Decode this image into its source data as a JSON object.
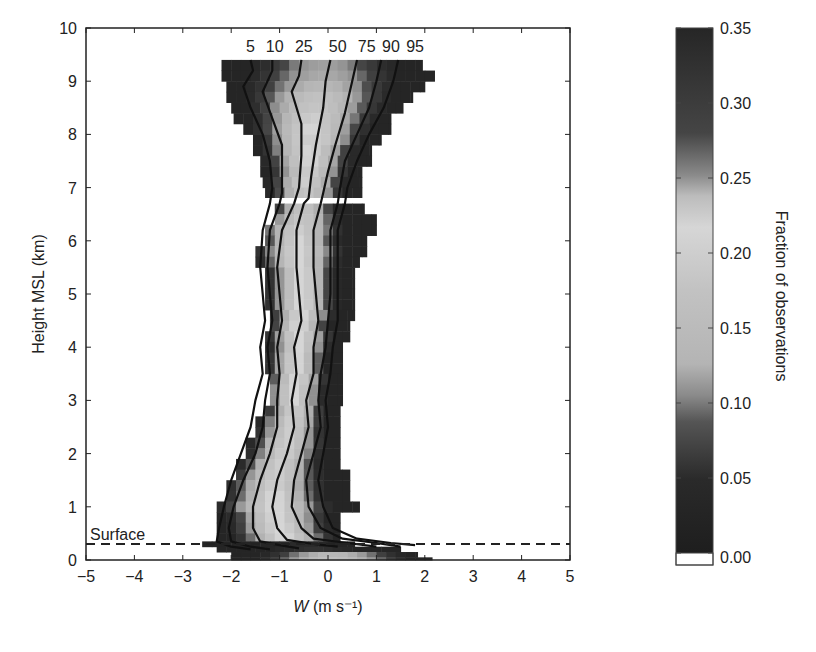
{
  "chart_data": {
    "type": "heatmap",
    "title": "",
    "xlabel": "W (m s⁻¹)",
    "xlabel_italic": "W",
    "xlabel_rest": " (m s⁻¹)",
    "ylabel": "Height MSL (km)",
    "colorbar_label": "Fraction of observations",
    "xlim": [
      -5,
      5
    ],
    "ylim": [
      0,
      10
    ],
    "x_ticks": [
      "−5",
      "−4",
      "−3",
      "−2",
      "−1",
      "0",
      "1",
      "2",
      "3",
      "4",
      "5"
    ],
    "y_ticks": [
      "0",
      "1",
      "2",
      "3",
      "4",
      "5",
      "6",
      "7",
      "8",
      "9",
      "10"
    ],
    "colorbar_ticks": [
      "0.00",
      "0.05",
      "0.10",
      "0.15",
      "0.20",
      "0.25",
      "0.30",
      "0.35"
    ],
    "colorbar_range": [
      0.0,
      0.35
    ],
    "surface_line": {
      "label": "Surface",
      "height_km": 0.3,
      "style": "dashed"
    },
    "percentile_labels": [
      "5",
      "10",
      "25",
      "50",
      "75",
      "90",
      "95"
    ],
    "percentiles": [
      {
        "p": 5,
        "points": [
          [
            -1.6,
            9.4
          ],
          [
            -1.55,
            9.2
          ],
          [
            -1.75,
            8.9
          ],
          [
            -1.6,
            8.5
          ],
          [
            -1.35,
            8.0
          ],
          [
            -1.2,
            7.5
          ],
          [
            -1.15,
            7.0
          ],
          [
            -1.2,
            6.7
          ],
          [
            -1.35,
            6.2
          ],
          [
            -1.4,
            5.5
          ],
          [
            -1.35,
            5.0
          ],
          [
            -1.3,
            4.5
          ],
          [
            -1.4,
            4.0
          ],
          [
            -1.35,
            3.5
          ],
          [
            -1.5,
            3.0
          ],
          [
            -1.6,
            2.5
          ],
          [
            -1.8,
            2.0
          ],
          [
            -2.0,
            1.5
          ],
          [
            -2.15,
            1.0
          ],
          [
            -2.25,
            0.6
          ],
          [
            -2.3,
            0.35
          ],
          [
            -2.0,
            0.25
          ],
          [
            -1.6,
            0.2
          ]
        ]
      },
      {
        "p": 10,
        "points": [
          [
            -1.15,
            9.4
          ],
          [
            -1.15,
            9.2
          ],
          [
            -1.35,
            8.8
          ],
          [
            -1.15,
            8.3
          ],
          [
            -0.95,
            7.8
          ],
          [
            -0.95,
            7.3
          ],
          [
            -0.95,
            6.9
          ],
          [
            -1.0,
            6.7
          ],
          [
            -1.2,
            6.2
          ],
          [
            -1.25,
            5.5
          ],
          [
            -1.2,
            5.0
          ],
          [
            -1.15,
            4.5
          ],
          [
            -1.25,
            4.0
          ],
          [
            -1.2,
            3.5
          ],
          [
            -1.3,
            3.0
          ],
          [
            -1.35,
            2.5
          ],
          [
            -1.5,
            2.0
          ],
          [
            -1.75,
            1.5
          ],
          [
            -1.95,
            1.0
          ],
          [
            -2.05,
            0.6
          ],
          [
            -2.0,
            0.35
          ],
          [
            -1.6,
            0.25
          ],
          [
            -1.2,
            0.2
          ]
        ]
      },
      {
        "p": 25,
        "points": [
          [
            -0.55,
            9.4
          ],
          [
            -0.6,
            9.1
          ],
          [
            -0.75,
            8.8
          ],
          [
            -0.55,
            8.2
          ],
          [
            -0.55,
            7.6
          ],
          [
            -0.6,
            7.0
          ],
          [
            -0.7,
            6.7
          ],
          [
            -0.95,
            6.2
          ],
          [
            -1.05,
            5.5
          ],
          [
            -1.0,
            5.0
          ],
          [
            -0.95,
            4.5
          ],
          [
            -1.05,
            4.0
          ],
          [
            -1.0,
            3.5
          ],
          [
            -1.05,
            3.0
          ],
          [
            -1.05,
            2.5
          ],
          [
            -1.2,
            2.0
          ],
          [
            -1.4,
            1.5
          ],
          [
            -1.55,
            1.0
          ],
          [
            -1.55,
            0.6
          ],
          [
            -1.4,
            0.35
          ],
          [
            -1.0,
            0.28
          ],
          [
            -0.6,
            0.22
          ]
        ]
      },
      {
        "p": 50,
        "points": [
          [
            0.05,
            9.4
          ],
          [
            -0.05,
            9.0
          ],
          [
            -0.1,
            8.5
          ],
          [
            -0.25,
            7.8
          ],
          [
            -0.35,
            7.2
          ],
          [
            -0.4,
            6.8
          ],
          [
            -0.5,
            6.7
          ],
          [
            -0.65,
            6.2
          ],
          [
            -0.65,
            5.5
          ],
          [
            -0.6,
            5.0
          ],
          [
            -0.55,
            4.5
          ],
          [
            -0.7,
            4.0
          ],
          [
            -0.65,
            3.5
          ],
          [
            -0.75,
            3.0
          ],
          [
            -0.7,
            2.5
          ],
          [
            -0.85,
            2.0
          ],
          [
            -1.05,
            1.5
          ],
          [
            -1.15,
            1.0
          ],
          [
            -1.05,
            0.6
          ],
          [
            -0.85,
            0.38
          ],
          [
            -0.3,
            0.3
          ],
          [
            0.2,
            0.25
          ]
        ]
      },
      {
        "p": 75,
        "points": [
          [
            0.6,
            9.4
          ],
          [
            0.5,
            9.0
          ],
          [
            0.35,
            8.4
          ],
          [
            0.15,
            7.8
          ],
          [
            0.0,
            7.3
          ],
          [
            -0.1,
            6.9
          ],
          [
            -0.15,
            6.7
          ],
          [
            -0.3,
            6.2
          ],
          [
            -0.3,
            5.5
          ],
          [
            -0.25,
            5.0
          ],
          [
            -0.2,
            4.5
          ],
          [
            -0.3,
            4.0
          ],
          [
            -0.3,
            3.5
          ],
          [
            -0.45,
            3.0
          ],
          [
            -0.4,
            2.5
          ],
          [
            -0.55,
            2.0
          ],
          [
            -0.7,
            1.5
          ],
          [
            -0.75,
            1.0
          ],
          [
            -0.55,
            0.6
          ],
          [
            -0.3,
            0.4
          ],
          [
            0.4,
            0.32
          ],
          [
            1.0,
            0.25
          ]
        ]
      },
      {
        "p": 90,
        "points": [
          [
            1.1,
            9.4
          ],
          [
            1.0,
            9.0
          ],
          [
            0.85,
            8.5
          ],
          [
            0.6,
            8.0
          ],
          [
            0.35,
            7.5
          ],
          [
            0.25,
            7.0
          ],
          [
            0.2,
            6.7
          ],
          [
            0.05,
            6.2
          ],
          [
            0.05,
            5.5
          ],
          [
            0.05,
            5.0
          ],
          [
            0.0,
            4.5
          ],
          [
            -0.05,
            4.0
          ],
          [
            -0.15,
            3.5
          ],
          [
            -0.2,
            3.0
          ],
          [
            -0.15,
            2.5
          ],
          [
            -0.3,
            2.0
          ],
          [
            -0.45,
            1.5
          ],
          [
            -0.4,
            1.0
          ],
          [
            -0.15,
            0.6
          ],
          [
            0.3,
            0.4
          ],
          [
            1.0,
            0.32
          ],
          [
            1.5,
            0.25
          ]
        ]
      },
      {
        "p": 95,
        "points": [
          [
            1.45,
            9.4
          ],
          [
            1.35,
            9.0
          ],
          [
            1.15,
            8.5
          ],
          [
            0.85,
            8.0
          ],
          [
            0.6,
            7.5
          ],
          [
            0.4,
            7.0
          ],
          [
            0.35,
            6.7
          ],
          [
            0.2,
            6.2
          ],
          [
            0.2,
            5.5
          ],
          [
            0.2,
            5.0
          ],
          [
            0.2,
            4.5
          ],
          [
            0.1,
            4.0
          ],
          [
            0.05,
            3.5
          ],
          [
            -0.05,
            3.0
          ],
          [
            0.0,
            2.5
          ],
          [
            -0.1,
            2.0
          ],
          [
            -0.2,
            1.5
          ],
          [
            -0.1,
            1.0
          ],
          [
            0.1,
            0.6
          ],
          [
            0.6,
            0.4
          ],
          [
            1.3,
            0.32
          ],
          [
            1.8,
            0.28
          ]
        ]
      }
    ],
    "bands": [
      {
        "y0": 9.2,
        "y1": 9.4,
        "x0": -2.2,
        "x1": 1.95,
        "peak": 0.13,
        "center": -0.1
      },
      {
        "y0": 9.0,
        "y1": 9.2,
        "x0": -2.2,
        "x1": 2.2,
        "peak": 0.14,
        "center": -0.1
      },
      {
        "y0": 8.8,
        "y1": 9.0,
        "x0": -2.1,
        "x1": 2.0,
        "peak": 0.16,
        "center": -0.15
      },
      {
        "y0": 8.6,
        "y1": 8.8,
        "x0": -2.1,
        "x1": 1.75,
        "peak": 0.19,
        "center": -0.2
      },
      {
        "y0": 8.4,
        "y1": 8.6,
        "x0": -2.0,
        "x1": 1.55,
        "peak": 0.2,
        "center": -0.25
      },
      {
        "y0": 8.2,
        "y1": 8.4,
        "x0": -1.95,
        "x1": 1.3,
        "peak": 0.21,
        "center": -0.3
      },
      {
        "y0": 8.0,
        "y1": 8.2,
        "x0": -1.75,
        "x1": 1.3,
        "peak": 0.22,
        "center": -0.35
      },
      {
        "y0": 7.8,
        "y1": 8.0,
        "x0": -1.55,
        "x1": 1.1,
        "peak": 0.23,
        "center": -0.35
      },
      {
        "y0": 7.6,
        "y1": 7.8,
        "x0": -1.55,
        "x1": 0.9,
        "peak": 0.22,
        "center": -0.4
      },
      {
        "y0": 7.4,
        "y1": 7.6,
        "x0": -1.4,
        "x1": 0.9,
        "peak": 0.22,
        "center": -0.4
      },
      {
        "y0": 7.2,
        "y1": 7.4,
        "x0": -1.4,
        "x1": 0.7,
        "peak": 0.21,
        "center": -0.4
      },
      {
        "y0": 7.0,
        "y1": 7.2,
        "x0": -1.35,
        "x1": 0.7,
        "peak": 0.21,
        "center": -0.45
      },
      {
        "y0": 6.8,
        "y1": 7.0,
        "x0": -1.3,
        "x1": 0.7,
        "peak": 0.2,
        "center": -0.45
      },
      {
        "y0": 6.5,
        "y1": 6.7,
        "x0": -1.1,
        "x1": 0.75,
        "peak": 0.19,
        "center": -0.5
      },
      {
        "y0": 6.3,
        "y1": 6.5,
        "x0": -1.1,
        "x1": 1.0,
        "peak": 0.2,
        "center": -0.55
      },
      {
        "y0": 6.1,
        "y1": 6.3,
        "x0": -1.3,
        "x1": 1.0,
        "peak": 0.21,
        "center": -0.6
      },
      {
        "y0": 5.9,
        "y1": 6.1,
        "x0": -1.3,
        "x1": 0.8,
        "peak": 0.22,
        "center": -0.6
      },
      {
        "y0": 5.7,
        "y1": 5.9,
        "x0": -1.5,
        "x1": 0.8,
        "peak": 0.22,
        "center": -0.6
      },
      {
        "y0": 5.5,
        "y1": 5.7,
        "x0": -1.5,
        "x1": 0.65,
        "peak": 0.22,
        "center": -0.6
      },
      {
        "y0": 5.3,
        "y1": 5.5,
        "x0": -1.3,
        "x1": 0.55,
        "peak": 0.22,
        "center": -0.55
      },
      {
        "y0": 5.1,
        "y1": 5.3,
        "x0": -1.3,
        "x1": 0.55,
        "peak": 0.22,
        "center": -0.55
      },
      {
        "y0": 4.9,
        "y1": 5.1,
        "x0": -1.3,
        "x1": 0.55,
        "peak": 0.22,
        "center": -0.55
      },
      {
        "y0": 4.7,
        "y1": 4.9,
        "x0": -1.3,
        "x1": 0.55,
        "peak": 0.22,
        "center": -0.55
      },
      {
        "y0": 4.5,
        "y1": 4.7,
        "x0": -1.2,
        "x1": 0.55,
        "peak": 0.22,
        "center": -0.55
      },
      {
        "y0": 4.3,
        "y1": 4.5,
        "x0": -1.2,
        "x1": 0.45,
        "peak": 0.22,
        "center": -0.6
      },
      {
        "y0": 4.1,
        "y1": 4.3,
        "x0": -1.3,
        "x1": 0.45,
        "peak": 0.22,
        "center": -0.6
      },
      {
        "y0": 3.9,
        "y1": 4.1,
        "x0": -1.3,
        "x1": 0.3,
        "peak": 0.22,
        "center": -0.6
      },
      {
        "y0": 3.7,
        "y1": 3.9,
        "x0": -1.3,
        "x1": 0.3,
        "peak": 0.22,
        "center": -0.65
      },
      {
        "y0": 3.5,
        "y1": 3.7,
        "x0": -1.3,
        "x1": 0.3,
        "peak": 0.22,
        "center": -0.65
      },
      {
        "y0": 3.3,
        "y1": 3.5,
        "x0": -1.2,
        "x1": 0.3,
        "peak": 0.22,
        "center": -0.65
      },
      {
        "y0": 3.1,
        "y1": 3.3,
        "x0": -1.2,
        "x1": 0.3,
        "peak": 0.22,
        "center": -0.7
      },
      {
        "y0": 2.9,
        "y1": 3.1,
        "x0": -1.2,
        "x1": 0.3,
        "peak": 0.22,
        "center": -0.7
      },
      {
        "y0": 2.7,
        "y1": 2.9,
        "x0": -1.3,
        "x1": 0.25,
        "peak": 0.21,
        "center": -0.7
      },
      {
        "y0": 2.5,
        "y1": 2.7,
        "x0": -1.5,
        "x1": 0.25,
        "peak": 0.21,
        "center": -0.75
      },
      {
        "y0": 2.3,
        "y1": 2.5,
        "x0": -1.5,
        "x1": 0.25,
        "peak": 0.21,
        "center": -0.8
      },
      {
        "y0": 2.1,
        "y1": 2.3,
        "x0": -1.7,
        "x1": 0.25,
        "peak": 0.21,
        "center": -0.85
      },
      {
        "y0": 1.9,
        "y1": 2.1,
        "x0": -1.7,
        "x1": 0.25,
        "peak": 0.21,
        "center": -0.9
      },
      {
        "y0": 1.7,
        "y1": 1.9,
        "x0": -1.9,
        "x1": 0.25,
        "peak": 0.21,
        "center": -1.0
      },
      {
        "y0": 1.5,
        "y1": 1.7,
        "x0": -1.9,
        "x1": 0.45,
        "peak": 0.21,
        "center": -1.05
      },
      {
        "y0": 1.3,
        "y1": 1.5,
        "x0": -2.1,
        "x1": 0.45,
        "peak": 0.21,
        "center": -1.1
      },
      {
        "y0": 1.1,
        "y1": 1.3,
        "x0": -2.1,
        "x1": 0.45,
        "peak": 0.22,
        "center": -1.1
      },
      {
        "y0": 0.9,
        "y1": 1.1,
        "x0": -2.3,
        "x1": 0.65,
        "peak": 0.22,
        "center": -1.1
      },
      {
        "y0": 0.7,
        "y1": 0.9,
        "x0": -2.3,
        "x1": 0.25,
        "peak": 0.22,
        "center": -1.05
      },
      {
        "y0": 0.5,
        "y1": 0.7,
        "x0": -2.3,
        "x1": 0.25,
        "peak": 0.22,
        "center": -1.0
      },
      {
        "y0": 0.35,
        "y1": 0.5,
        "x0": -2.3,
        "x1": 0.25,
        "peak": 0.22,
        "center": -0.9
      },
      {
        "y0": 0.25,
        "y1": 0.35,
        "x0": -2.6,
        "x1": 0.55,
        "peak": 0.05,
        "center": -0.5
      },
      {
        "y0": 0.15,
        "y1": 0.25,
        "x0": -2.3,
        "x1": 1.5,
        "peak": 0.06,
        "center": -0.3
      },
      {
        "y0": 0.05,
        "y1": 0.15,
        "x0": -2.0,
        "x1": 1.85,
        "peak": 0.16,
        "center": 0.1
      },
      {
        "y0": 0.0,
        "y1": 0.05,
        "x0": -2.0,
        "x1": 2.15,
        "peak": 0.18,
        "center": 0.1
      }
    ]
  }
}
